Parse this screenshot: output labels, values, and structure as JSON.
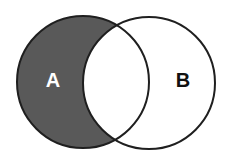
{
  "diagram": {
    "type": "venn",
    "title": "",
    "sets": [
      {
        "id": "A",
        "label": "A",
        "cx": 83,
        "cy": 82,
        "r": 66,
        "label_x": 53,
        "label_y": 87,
        "label_color": "#ffffff"
      },
      {
        "id": "B",
        "label": "B",
        "cx": 149,
        "cy": 83,
        "r": 66,
        "label_x": 183,
        "label_y": 87,
        "label_color": "#111111"
      }
    ],
    "highlighted_region": "A minus B",
    "colors": {
      "fill": "#595959",
      "stroke": "#1f1f1f",
      "background": "#ffffff"
    }
  }
}
